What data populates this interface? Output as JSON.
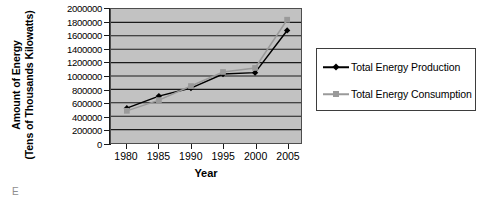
{
  "chart_data": {
    "type": "line",
    "title": "",
    "xlabel": "Year",
    "ylabel": "Amount of Energy (Tens of Thousands Kilowatts)",
    "ylabel_line1": "Amount of Energy",
    "ylabel_line2": "(Tens of Thousands Kilowatts)",
    "categories": [
      "1980",
      "1985",
      "1990",
      "1995",
      "2000",
      "2005"
    ],
    "x": [
      1980,
      1985,
      1990,
      1995,
      2000,
      2005
    ],
    "xlim": [
      1978,
      2007
    ],
    "ylim": [
      0,
      2000000
    ],
    "yticks": [
      0,
      200000,
      400000,
      600000,
      800000,
      1000000,
      1200000,
      1400000,
      1600000,
      1800000,
      2000000
    ],
    "ytick_labels": [
      "0",
      "200000",
      "400000",
      "600000",
      "800000",
      "1000000",
      "1200000",
      "1400000",
      "1600000",
      "1800000",
      "2000000"
    ],
    "grid": "horizontal",
    "gridline_color": "#1a1a1a",
    "plot_background": "#c2c2c2",
    "legend_position": "right",
    "series": [
      {
        "name": "Total Energy Production",
        "color": "#000000",
        "marker": "diamond",
        "values": [
          520000,
          700000,
          820000,
          1030000,
          1050000,
          1680000
        ]
      },
      {
        "name": "Total Energy Consumption",
        "color": "#9a9a9a",
        "marker": "square",
        "values": [
          480000,
          640000,
          850000,
          1060000,
          1120000,
          1840000
        ]
      }
    ]
  },
  "legend": {
    "items": [
      {
        "label": "Total Energy Production"
      },
      {
        "label": "Total Energy Consumption"
      }
    ]
  },
  "caption": {
    "text": "E"
  }
}
